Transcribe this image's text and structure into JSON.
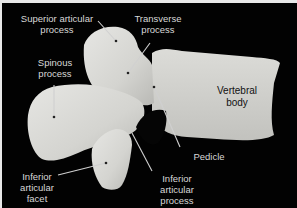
{
  "figure": {
    "background_color": "#020202",
    "bone_color": "#d9d9d6",
    "label_color": "#d8d8d8",
    "labels": [
      {
        "id": "superior-articular-process",
        "line1": "Superior articular",
        "line2": "process"
      },
      {
        "id": "transverse-process",
        "line1": "Transverse",
        "line2": "process"
      },
      {
        "id": "spinous-process",
        "line1": "Spinous",
        "line2": "process"
      },
      {
        "id": "vertebral-body",
        "line1": "Vertebral",
        "line2": "body"
      },
      {
        "id": "pedicle",
        "line1": "Pedicle"
      },
      {
        "id": "inferior-articular-facet",
        "line1": "Inferior",
        "line2": "articular",
        "line3": "facet"
      },
      {
        "id": "inferior-articular-process",
        "line1": "Inferior",
        "line2": "articular",
        "line3": "process"
      }
    ]
  }
}
